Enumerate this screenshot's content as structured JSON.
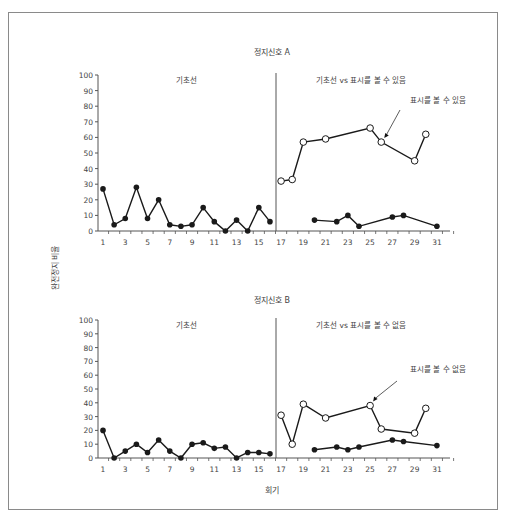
{
  "figure": {
    "y_axis_label": "완전정지 비율",
    "x_axis_label": "회기"
  },
  "chart_data": [
    {
      "type": "line",
      "title": "정지신호 A",
      "xlabel": "회기",
      "ylabel": "완전정지 비율",
      "ylim": [
        0,
        100
      ],
      "yticks": [
        0,
        10,
        20,
        30,
        40,
        50,
        60,
        70,
        80,
        90,
        100
      ],
      "xlim": [
        1,
        32
      ],
      "xtick_labels": [
        1,
        3,
        5,
        7,
        9,
        11,
        13,
        15,
        17,
        19,
        21,
        23,
        25,
        27,
        29,
        31
      ],
      "grid": false,
      "phases": [
        {
          "label": "기초선",
          "start": 1,
          "end": 16
        },
        {
          "label": "기초선 vs 표시를 볼 수 있음",
          "start": 17,
          "end": 31
        }
      ],
      "phase_line_x": 16.5,
      "annotation": {
        "text": "표시를 볼 수 있음",
        "points_to": 26
      },
      "series": [
        {
          "name": "기초선",
          "marker": "filled",
          "x": [
            1,
            2,
            3,
            4,
            5,
            6,
            7,
            8,
            9,
            10,
            11,
            12,
            13,
            14,
            15,
            16
          ],
          "values": [
            27,
            4,
            8,
            28,
            8,
            20,
            4,
            3,
            4,
            15,
            6,
            0,
            7,
            0,
            15,
            6
          ]
        },
        {
          "name": "표시를 볼 수 있음",
          "marker": "open",
          "x": [
            17,
            18,
            19,
            21,
            25,
            26,
            29,
            30
          ],
          "values": [
            32,
            33,
            57,
            59,
            66,
            57,
            45,
            62
          ]
        },
        {
          "name": "기초선 (교대)",
          "marker": "filled",
          "x": [
            20,
            22,
            23,
            24,
            27,
            28,
            31
          ],
          "values": [
            7,
            6,
            10,
            3,
            9,
            10,
            3
          ]
        }
      ]
    },
    {
      "type": "line",
      "title": "정지신호 B",
      "xlabel": "회기",
      "ylabel": "완전정지 비율",
      "ylim": [
        0,
        100
      ],
      "yticks": [
        0,
        10,
        20,
        30,
        40,
        50,
        60,
        70,
        80,
        90,
        100
      ],
      "xlim": [
        1,
        32
      ],
      "xtick_labels": [
        1,
        3,
        5,
        7,
        9,
        11,
        13,
        15,
        17,
        19,
        21,
        23,
        25,
        27,
        29,
        31
      ],
      "grid": false,
      "phases": [
        {
          "label": "기초선",
          "start": 1,
          "end": 16
        },
        {
          "label": "기초선 vs 표시를 볼 수 없음",
          "start": 17,
          "end": 31
        }
      ],
      "phase_line_x": 16.5,
      "annotation": {
        "text": "표시를 볼 수 없음",
        "points_to": 25
      },
      "series": [
        {
          "name": "기초선",
          "marker": "filled",
          "x": [
            1,
            2,
            3,
            4,
            5,
            6,
            7,
            8,
            9,
            10,
            11,
            12,
            13,
            14,
            15,
            16
          ],
          "values": [
            20,
            0,
            5,
            10,
            4,
            13,
            5,
            0,
            10,
            11,
            7,
            8,
            0,
            4,
            4,
            3
          ]
        },
        {
          "name": "표시를 볼 수 없음",
          "marker": "open",
          "x": [
            17,
            18,
            19,
            21,
            25,
            26,
            29,
            30
          ],
          "values": [
            31,
            10,
            39,
            29,
            38,
            21,
            18,
            36
          ]
        },
        {
          "name": "기초선 (교대)",
          "marker": "filled",
          "x": [
            20,
            22,
            23,
            24,
            27,
            28,
            31
          ],
          "values": [
            6,
            8,
            6,
            8,
            13,
            12,
            9
          ]
        }
      ]
    }
  ],
  "colors": {
    "line": "#1a1a1a",
    "text": "#444444",
    "frame": "#8a8a8a"
  }
}
